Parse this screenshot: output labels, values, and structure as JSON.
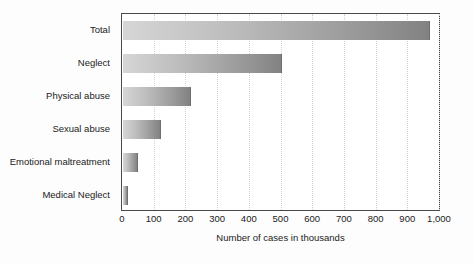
{
  "chart_data": {
    "type": "bar",
    "orientation": "horizontal",
    "title": "",
    "xlabel": "Number of cases in thousands",
    "ylabel": "",
    "categories": [
      "Total",
      "Neglect",
      "Physical abuse",
      "Sexual abuse",
      "Emotional maltreatment",
      "Medical Neglect"
    ],
    "values": [
      970,
      500,
      215,
      120,
      48,
      17
    ],
    "xlim": [
      0,
      1000
    ],
    "xticks": [
      0,
      100,
      200,
      300,
      400,
      500,
      600,
      700,
      800,
      900,
      1000
    ],
    "xtick_labels": [
      "0",
      "100",
      "200",
      "300",
      "400",
      "500",
      "600",
      "700",
      "800",
      "900",
      "1,000"
    ],
    "grid": "vertical-dotted",
    "legend": "none",
    "bar_color_start": "#d6d6d6",
    "bar_color_end": "#828282",
    "frame_color": "#4a4a4a",
    "gridline_color": "#d2d2d2",
    "background": "#ffffff"
  }
}
